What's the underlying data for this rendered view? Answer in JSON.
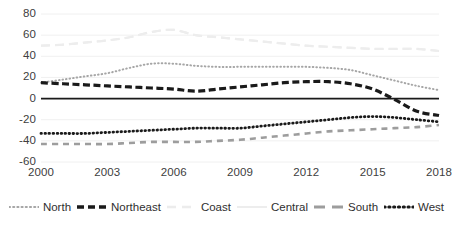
{
  "chart_data": {
    "type": "line",
    "title": "",
    "subtitle": "",
    "xlabel": "",
    "ylabel": "",
    "xlim": [
      2000,
      2018
    ],
    "ylim": [
      -60,
      80
    ],
    "yticks": [
      80,
      60,
      40,
      20,
      0,
      -20,
      -40,
      -60
    ],
    "xticks": [
      2000,
      2003,
      2006,
      2009,
      2012,
      2015,
      2018
    ],
    "grid": "horizontal-light",
    "legend_position": "bottom",
    "zero_line": true,
    "x": [
      2000,
      2001,
      2002,
      2003,
      2004,
      2005,
      2006,
      2007,
      2008,
      2009,
      2010,
      2011,
      2012,
      2013,
      2014,
      2015,
      2016,
      2017,
      2018
    ],
    "series": [
      {
        "name": "North",
        "style": "fine-dotted",
        "color": "#a6a6a6",
        "width": 2.0,
        "values": [
          15,
          18,
          21,
          24,
          29,
          33,
          33,
          31,
          30,
          30,
          30,
          30,
          30,
          29,
          27,
          22,
          17,
          12,
          8
        ]
      },
      {
        "name": "Northeast",
        "style": "thick-dashed",
        "color": "#1a1a1a",
        "width": 3.2,
        "values": [
          15,
          14,
          13,
          12,
          11,
          10,
          9,
          7,
          9,
          11,
          13,
          15,
          16,
          16,
          14,
          9,
          -1,
          -12,
          -16
        ]
      },
      {
        "name": "Coast",
        "style": "light-long-dash",
        "color": "#ececec",
        "width": 2.2,
        "values": [
          50,
          51,
          53,
          55,
          58,
          63,
          65,
          60,
          58,
          56,
          54,
          52,
          50,
          49,
          48,
          47,
          47,
          47,
          45
        ]
      },
      {
        "name": "Central",
        "style": "light-solid",
        "color": "#ededed",
        "width": 2.0,
        "values": [
          50,
          51,
          53,
          55,
          58,
          63,
          65,
          60,
          58,
          56,
          54,
          52,
          50,
          49,
          48,
          47,
          47,
          47,
          45
        ]
      },
      {
        "name": "South",
        "style": "gray-dashed",
        "color": "#9d9d9d",
        "width": 2.6,
        "values": [
          -43,
          -43,
          -43,
          -43,
          -42,
          -41,
          -41,
          -41,
          -40,
          -39,
          -37,
          -35,
          -33,
          -31,
          -30,
          -29,
          -28,
          -27,
          -25
        ]
      },
      {
        "name": "West",
        "style": "bold-dotted",
        "color": "#1a1a1a",
        "width": 2.8,
        "values": [
          -33,
          -33,
          -33,
          -32,
          -31,
          -30,
          -29,
          -28,
          -28,
          -28,
          -26,
          -24,
          -22,
          -20,
          -18,
          -17,
          -18,
          -20,
          -22
        ]
      }
    ]
  },
  "y_axis": {
    "ticks": [
      "80",
      "60",
      "40",
      "20",
      "0",
      "-20",
      "-40",
      "-60"
    ]
  },
  "x_axis": {
    "ticks": [
      "2000",
      "2003",
      "2006",
      "2009",
      "2012",
      "2015",
      "2018"
    ]
  },
  "legend": {
    "items": [
      {
        "label": "North"
      },
      {
        "label": "Northeast"
      },
      {
        "label": "Coast"
      },
      {
        "label": "Central"
      },
      {
        "label": "South"
      },
      {
        "label": "West"
      }
    ]
  }
}
